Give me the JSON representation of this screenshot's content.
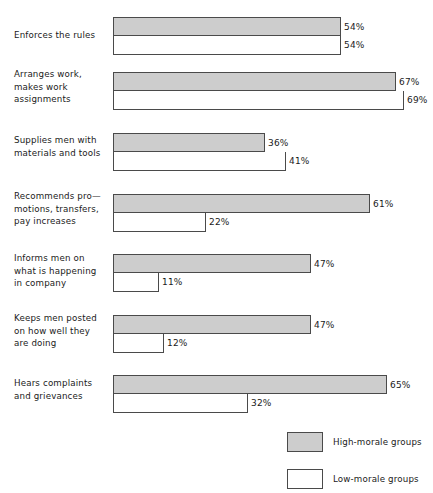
{
  "chart_data": {
    "type": "bar",
    "title": "",
    "subtitle": "",
    "xlabel": "",
    "ylabel": "",
    "orientation": "horizontal",
    "grid": false,
    "xlim": [
      0,
      75
    ],
    "value_suffix": "%",
    "legend_position": "bottom-right",
    "categories": [
      "Enforces the rules",
      "Arranges work,\nmakes work\nassignments",
      "Supplies men with\nmaterials and tools",
      "Recommends pro—\nmotions, transfers,\npay increases",
      "Informs men on\nwhat is  happening\nin company",
      "Keeps men posted\non how well they\nare doing",
      "Hears complaints\nand grievances"
    ],
    "series": [
      {
        "name": "High-morale groups",
        "color": "#cdcdcd",
        "values": [
          54,
          67,
          36,
          61,
          47,
          47,
          65
        ],
        "labels": [
          "54%",
          "67%",
          "36%",
          "61%",
          "47%",
          "47%",
          "65%"
        ]
      },
      {
        "name": "Low-morale groups",
        "color": "#ffffff",
        "values": [
          54,
          69,
          41,
          22,
          11,
          12,
          32
        ],
        "labels": [
          "54%",
          "69%",
          "41%",
          "22%",
          "11%",
          "12%",
          "32%"
        ]
      }
    ]
  },
  "legend": {
    "items": [
      {
        "label": "High-morale groups",
        "swatch": "high"
      },
      {
        "label": "Low-morale groups",
        "swatch": "low"
      }
    ]
  },
  "layout": {
    "bar_origin_x": 113,
    "px_per_percent": 4.22,
    "bar_height": 19,
    "row_tops": [
      17,
      72,
      133,
      194,
      254,
      315,
      375
    ],
    "label_tops": [
      29,
      68,
      134,
      190,
      252,
      312,
      377
    ]
  }
}
